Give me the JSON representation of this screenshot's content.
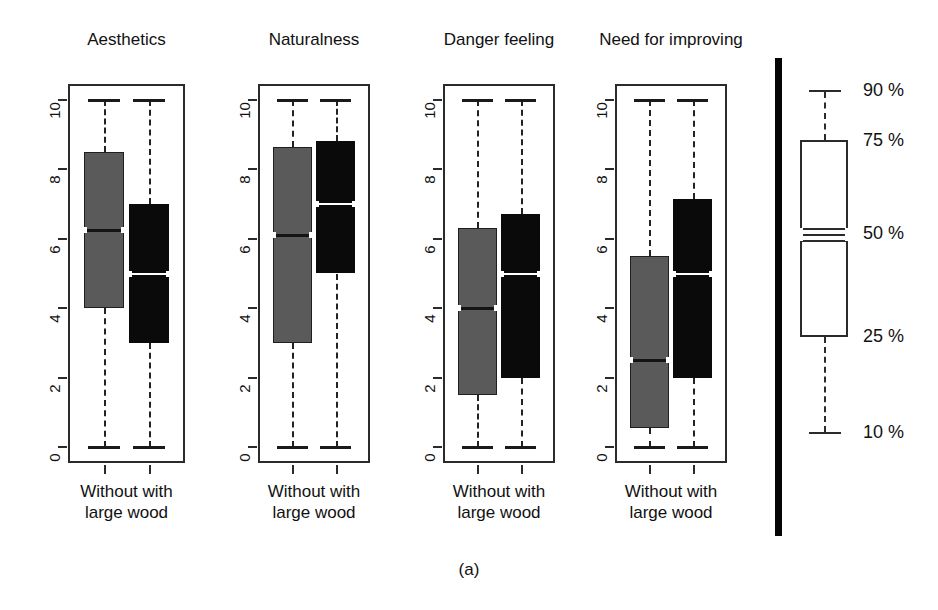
{
  "figure": {
    "caption": "(a)",
    "axis_ticks": [
      "10",
      "8",
      "6",
      "4",
      "2",
      "0"
    ],
    "group_labels_line1": "Without  with",
    "group_labels_line2": "large wood"
  },
  "legend": {
    "title": "",
    "labels": [
      "90 %",
      "75 %",
      "50 %",
      "25 %",
      "10 %"
    ],
    "box_color": "#ffffff",
    "line_color": "#2b2b2b"
  },
  "colors": {
    "without_large_wood": "#5a5a5a",
    "with_large_wood": "#0a0a0a",
    "frame": "#2b2b2b",
    "divider": "#050505"
  },
  "chart_data": {
    "type": "box",
    "title": "",
    "subtitle": "",
    "xlabel": "",
    "ylabel": "",
    "ylim": [
      0,
      10
    ],
    "yticks": [
      0,
      2,
      4,
      6,
      8,
      10
    ],
    "grid": false,
    "legend_position": "right",
    "legend_entries": [
      "90 %",
      "75 %",
      "50 %",
      "25 %",
      "10 %"
    ],
    "categories": [
      "Without large wood",
      "with large wood"
    ],
    "panels": [
      {
        "title": "Aesthetics",
        "boxes": [
          {
            "group": "Without large wood",
            "color": "#5a5a5a",
            "whisker_low": 0,
            "q1": 4.0,
            "median": 6.25,
            "q3": 8.5,
            "whisker_high": 10
          },
          {
            "group": "with large wood",
            "color": "#0a0a0a",
            "whisker_low": 0,
            "q1": 3.0,
            "median": 5.0,
            "q3": 7.0,
            "whisker_high": 10
          }
        ]
      },
      {
        "title": "Naturalness",
        "boxes": [
          {
            "group": "Without large wood",
            "color": "#5a5a5a",
            "whisker_low": 0,
            "q1": 3.0,
            "median": 6.1,
            "q3": 8.65,
            "whisker_high": 10
          },
          {
            "group": "with large wood",
            "color": "#0a0a0a",
            "whisker_low": 0,
            "q1": 5.0,
            "median": 7.0,
            "q3": 8.8,
            "whisker_high": 10
          }
        ]
      },
      {
        "title": "Danger feeling",
        "boxes": [
          {
            "group": "Without large wood",
            "color": "#5a5a5a",
            "whisker_low": 0,
            "q1": 1.5,
            "median": 4.0,
            "q3": 6.3,
            "whisker_high": 10
          },
          {
            "group": "with large wood",
            "color": "#0a0a0a",
            "whisker_low": 0,
            "q1": 2.0,
            "median": 5.0,
            "q3": 6.7,
            "whisker_high": 10
          }
        ]
      },
      {
        "title": "Need for improving",
        "boxes": [
          {
            "group": "Without large wood",
            "color": "#5a5a5a",
            "whisker_low": 0,
            "q1": 0.55,
            "median": 2.5,
            "q3": 5.5,
            "whisker_high": 10
          },
          {
            "group": "with large wood",
            "color": "#0a0a0a",
            "whisker_low": 0,
            "q1": 2.0,
            "median": 5.0,
            "q3": 7.15,
            "whisker_high": 10
          }
        ]
      }
    ],
    "legend_box": {
      "whisker_high_label": "90 %",
      "q3_label": "75 %",
      "median_label": "50 %",
      "q1_label": "25 %",
      "whisker_low_label": "10 %"
    }
  }
}
